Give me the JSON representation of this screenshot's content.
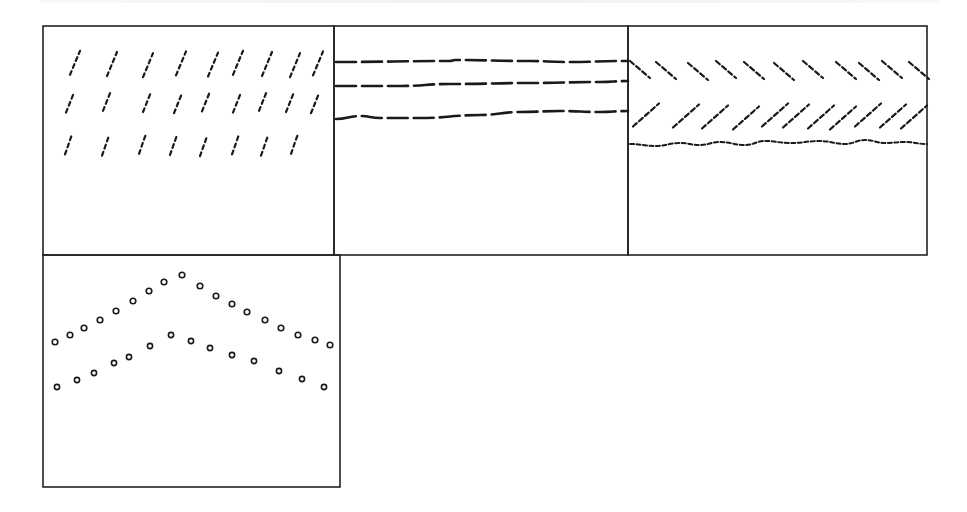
{
  "figure": {
    "type": "multi-panel line-pattern diagram",
    "background": "#ffffff",
    "ink_color": "#1a1a1a",
    "frame_color": "#222222",
    "panels": [
      {
        "id": "A",
        "bounds": [
          43,
          26,
          334,
          255
        ],
        "content": "slanted dashed strokes (forward slash)",
        "rows": [
          {
            "y_top": 52,
            "y_bottom": 76,
            "strokes_x_bottom": [
              70,
              107,
              143,
              176,
              208,
              233,
              262,
              290,
              313
            ],
            "lean": 10,
            "count": 9
          },
          {
            "y_top": 92,
            "y_bottom": 112,
            "strokes_x_bottom": [
              66,
              103,
              143,
              174,
              202,
              233,
              259,
              286,
              311
            ],
            "lean": 8,
            "count": 9
          },
          {
            "y_top": 135,
            "y_bottom": 155,
            "strokes_x_bottom": [
              65,
              102,
              139,
              170,
              200,
              232,
              261,
              291
            ],
            "lean": 7,
            "count": 8
          }
        ]
      },
      {
        "id": "B",
        "bounds": [
          334,
          26,
          628,
          255
        ],
        "content": "horizontal dashed lines",
        "lines": [
          {
            "points": [
              [
                336,
                62
              ],
              [
                450,
                61
              ],
              [
                455,
                60
              ],
              [
                530,
                61
              ],
              [
                565,
                62
              ],
              [
                628,
                61
              ]
            ]
          },
          {
            "points": [
              [
                336,
                86
              ],
              [
                400,
                86
              ],
              [
                450,
                84
              ],
              [
                530,
                83
              ],
              [
                600,
                82
              ],
              [
                628,
                81
              ]
            ]
          },
          {
            "points": [
              [
                336,
                119
              ],
              [
                360,
                116
              ],
              [
                380,
                118
              ],
              [
                420,
                118
              ],
              [
                480,
                115
              ],
              [
                520,
                112
              ],
              [
                560,
                111
              ],
              [
                600,
                112
              ],
              [
                628,
                111
              ]
            ]
          }
        ]
      },
      {
        "id": "C",
        "bounds": [
          628,
          26,
          927,
          255
        ],
        "content": "backslash strokes, forward-slash strokes, wavy dotted line",
        "backslash_row": {
          "y_top": 62,
          "y_bottom": 79,
          "x_starts": [
            630,
            656,
            688,
            716,
            744,
            774,
            803,
            836,
            859,
            882,
            909
          ],
          "dx": 20,
          "count": 11
        },
        "slash_row": {
          "y_bottom": 128,
          "y_top": 105,
          "x_starts": [
            633,
            673,
            702,
            733,
            762,
            783,
            808,
            830,
            855,
            880,
            901
          ],
          "dx": 26,
          "count": 11
        },
        "dotted_line": {
          "points": [
            [
              630,
              144
            ],
            [
              655,
              146
            ],
            [
              680,
              143
            ],
            [
              700,
              145
            ],
            [
              720,
              142
            ],
            [
              745,
              145
            ],
            [
              765,
              141
            ],
            [
              790,
              143
            ],
            [
              820,
              141
            ],
            [
              845,
              144
            ],
            [
              865,
              140
            ],
            [
              885,
              143
            ],
            [
              905,
              142
            ],
            [
              927,
              144
            ]
          ]
        }
      },
      {
        "id": "D",
        "bounds": [
          43,
          255,
          340,
          487
        ],
        "content": "two chevron series of open circle markers",
        "series": [
          {
            "name": "upper",
            "points": [
              [
                55,
                342
              ],
              [
                70,
                335
              ],
              [
                84,
                328
              ],
              [
                100,
                320
              ],
              [
                116,
                311
              ],
              [
                133,
                301
              ],
              [
                149,
                291
              ],
              [
                164,
                282
              ],
              [
                182,
                275
              ],
              [
                200,
                286
              ],
              [
                216,
                296
              ],
              [
                232,
                304
              ],
              [
                247,
                312
              ],
              [
                265,
                320
              ],
              [
                281,
                328
              ],
              [
                298,
                335
              ],
              [
                315,
                340
              ],
              [
                330,
                345
              ]
            ]
          },
          {
            "name": "lower",
            "points": [
              [
                57,
                387
              ],
              [
                77,
                380
              ],
              [
                94,
                373
              ],
              [
                114,
                363
              ],
              [
                129,
                357
              ],
              [
                150,
                346
              ],
              [
                171,
                335
              ],
              [
                191,
                341
              ],
              [
                210,
                348
              ],
              [
                232,
                355
              ],
              [
                254,
                361
              ],
              [
                279,
                371
              ],
              [
                302,
                379
              ],
              [
                324,
                387
              ]
            ]
          }
        ]
      }
    ]
  }
}
